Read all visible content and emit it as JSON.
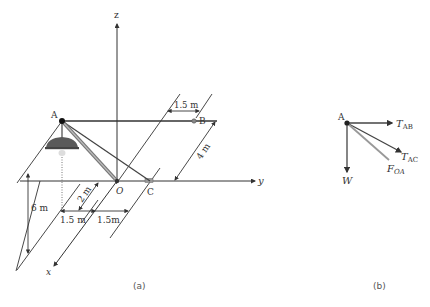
{
  "figure_a": {
    "caption": "(a)",
    "axes": {
      "z": "z",
      "y": "y",
      "x": "x",
      "origin": "O"
    },
    "points": {
      "A": "A",
      "B": "B",
      "C": "C"
    },
    "dimensions": {
      "ab_offset": "1.5 m",
      "depth_4m": "4 m",
      "height_6m": "6 m",
      "x_2m": "2 m",
      "left_1_5m": "1.5 m",
      "right_1_5m": "1.5m"
    },
    "colors": {
      "line": "#333333",
      "strut": "#888888",
      "lamp": "#555555"
    }
  },
  "figure_b": {
    "caption": "(b)",
    "point": "A",
    "forces": [
      {
        "name": "T",
        "sub": "AB"
      },
      {
        "name": "T",
        "sub": "AC"
      },
      {
        "name": "F",
        "sub": "OA"
      },
      {
        "name": "W",
        "sub": ""
      }
    ]
  }
}
